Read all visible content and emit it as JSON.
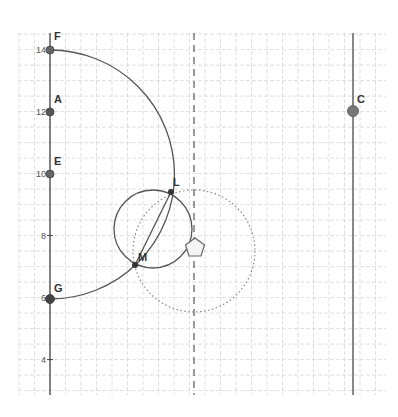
{
  "app": {
    "view": "Graphics View"
  },
  "colors": {
    "background": "#ffffff",
    "grid": "#d8d8d8",
    "axis": "#444444",
    "curve": "#555555",
    "point": "#555555",
    "point_C": "#777777",
    "dotted_circle": "#888888",
    "dashed_line": "#666666"
  },
  "axis": {
    "y_ticks": [
      {
        "label": "14",
        "value": 14
      },
      {
        "label": "12",
        "value": 12
      },
      {
        "label": "10",
        "value": 10
      },
      {
        "label": "8",
        "value": 8
      },
      {
        "label": "6",
        "value": 6
      },
      {
        "label": "4",
        "value": 4
      }
    ]
  },
  "points": [
    {
      "name": "F",
      "label": "F",
      "x": 0,
      "y": 14
    },
    {
      "name": "A",
      "label": "A",
      "x": 0,
      "y": 12
    },
    {
      "name": "E",
      "label": "E",
      "x": 0,
      "y": 10
    },
    {
      "name": "G",
      "label": "G",
      "x": 0,
      "y": 6
    },
    {
      "name": "L",
      "label": "L",
      "x": 3.9,
      "y": 9.4
    },
    {
      "name": "M",
      "label": "M",
      "x": 2.7,
      "y": 7.1
    },
    {
      "name": "C",
      "label": "C",
      "x": 9.8,
      "y": 12
    }
  ],
  "objects": {
    "big_arc": "arc through F, L, M, G",
    "small_circle": "circle through L and M",
    "dotted_circle": "dotted circle",
    "dashed_line": "dashed vertical line",
    "vertical_line": "vertical line through C",
    "segment_LM": "segment LM",
    "pentagon": "pentagon shape"
  }
}
